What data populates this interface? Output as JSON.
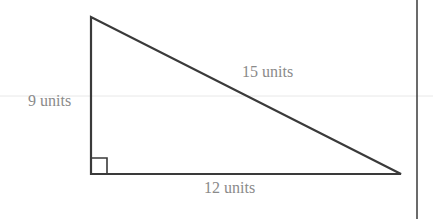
{
  "diagram": {
    "type": "right-triangle",
    "sides": {
      "vertical_leg": {
        "label": "9 units",
        "length": 9
      },
      "horizontal_leg": {
        "label": "12 units",
        "length": 12
      },
      "hypotenuse": {
        "label": "15 units",
        "length": 15
      }
    },
    "right_angle_marker": true,
    "colors": {
      "stroke": "#3a3a3a",
      "label": "#8a8a8a",
      "guide_line": "#e6e6e6",
      "divider": "#3a3a3a"
    }
  }
}
